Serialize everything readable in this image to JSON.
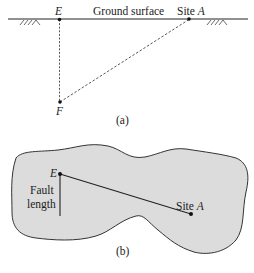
{
  "panel_a": {
    "caption": "(a)",
    "ground_label": "Ground surface",
    "point_e": "E",
    "point_f": "F",
    "site_prefix": "Site ",
    "site_letter": "A"
  },
  "panel_b": {
    "caption": "(b)",
    "point_e": "E",
    "fault_label_line1": "Fault",
    "fault_label_line2": "length",
    "site_prefix": "Site ",
    "site_letter": "A"
  },
  "colors": {
    "line": "#222222",
    "region_fill": "#dcdcdc",
    "region_stroke": "#333333"
  }
}
